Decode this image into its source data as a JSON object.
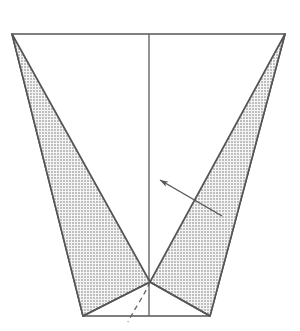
{
  "figure": {
    "background_color": "#ffffff",
    "line_color": "#555555",
    "stipple_dot_color": "#777777",
    "stipple_fill_color": "#f2f2f2",
    "outline_width": 1.6,
    "canvas": {
      "width": 300,
      "height": 331
    }
  },
  "geometry": {
    "outer_trapezoid": {
      "name": "container-outline",
      "points": "12,34 285,34 210,316 83,316",
      "corners": {
        "top_left": [
          12,
          34
        ],
        "top_right": [
          285,
          34
        ],
        "bottom_right": [
          210,
          316
        ],
        "bottom_left": [
          83,
          316
        ]
      }
    },
    "center_line": {
      "name": "vertical-center-line",
      "x": 149,
      "y1": 34,
      "y2": 316
    },
    "left_lobe": {
      "name": "left-stippled-lobe",
      "points": "12,34 150,282 83,316"
    },
    "right_lobe": {
      "name": "right-stippled-lobe",
      "points": "285,34 210,316 150,282"
    },
    "apex": [
      150,
      282
    ],
    "fold_left": {
      "from": [
        83,
        316
      ],
      "to": [
        150,
        282
      ]
    },
    "fold_right": {
      "from": [
        210,
        316
      ],
      "to": [
        150,
        282
      ]
    },
    "dashed_arc": {
      "name": "dashed-fold-arc",
      "path": "M150,282 C144,296 136,306 128,322",
      "dash": "5,4"
    },
    "leader_arrow": {
      "name": "leader-arrow",
      "tail": [
        222,
        216
      ],
      "tip": [
        160,
        180
      ]
    }
  },
  "labels": {
    "arrow_label": "",
    "figure_caption": ""
  }
}
